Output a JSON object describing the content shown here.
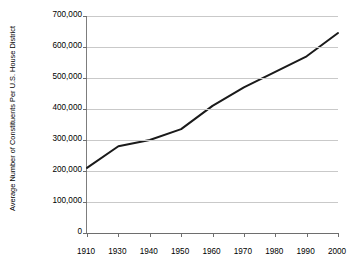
{
  "chart_data": {
    "type": "line",
    "title": "",
    "xlabel": "",
    "ylabel": "Average Number of Constituents Per U.S. House District",
    "categories": [
      "1910",
      "1930",
      "1940",
      "1950",
      "1960",
      "1970",
      "1980",
      "1990",
      "2000"
    ],
    "x": [
      1910,
      1930,
      1940,
      1950,
      1960,
      1970,
      1980,
      1990,
      2000
    ],
    "values": [
      210000,
      280000,
      300000,
      335000,
      410000,
      470000,
      520000,
      570000,
      645000
    ],
    "series": [
      {
        "name": "Average Number of Constituents Per U.S. House District",
        "values": [
          210000,
          280000,
          300000,
          335000,
          410000,
          470000,
          520000,
          570000,
          645000
        ],
        "color": "#1a1a1a",
        "line_width": 2
      }
    ],
    "ylim": [
      0,
      700000
    ],
    "yticks": [
      0,
      100000,
      200000,
      300000,
      400000,
      500000,
      600000,
      700000
    ],
    "ytick_labels": [
      "0",
      "100,000",
      "200,000",
      "300,000",
      "400,000",
      "500,000",
      "600,000",
      "700,000"
    ],
    "xtick_labels": [
      "1910",
      "1930",
      "1940",
      "1950",
      "1960",
      "1970",
      "1980",
      "1990",
      "2000"
    ],
    "grid": {
      "horizontal": true,
      "vertical": false,
      "color": "#c9c9c9"
    },
    "legend": {
      "visible": false,
      "position": "none"
    },
    "axes": {
      "left_spine": true,
      "bottom_spine": true,
      "top_spine": false,
      "right_spine": false,
      "axis_color": "#6e6e6e"
    },
    "background": "#ffffff",
    "note": "X axis positions are evenly spaced by category label, so the 1910-1930 gap occupies one slot like every other interval."
  }
}
